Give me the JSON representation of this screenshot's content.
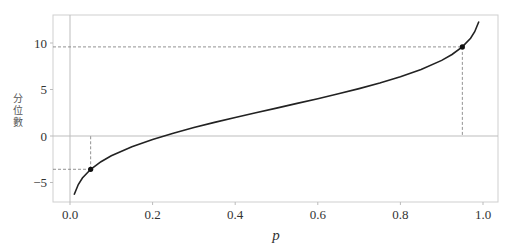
{
  "chart_data": {
    "type": "line",
    "title": "",
    "xlabel": "p",
    "ylabel": "分位數",
    "xlim": [
      -0.03,
      1.03
    ],
    "ylim": [
      -7.2,
      13.5
    ],
    "xticks": [
      0.0,
      0.2,
      0.4,
      0.6,
      0.8,
      1.0
    ],
    "xtick_labels": [
      "0.0",
      "0.2",
      "0.4",
      "0.6",
      "0.8",
      "1.0"
    ],
    "yticks": [
      -5,
      0,
      5,
      10
    ],
    "ytick_labels": [
      "−5",
      "0",
      "5",
      "10"
    ],
    "grid": false,
    "reference_lines": {
      "horizontal": 0,
      "vertical": 0
    },
    "series": [
      {
        "name": "quantile function (Normal μ=3, σ=4)",
        "x": [
          0.01,
          0.02,
          0.03,
          0.05,
          0.075,
          0.1,
          0.15,
          0.2,
          0.25,
          0.3,
          0.35,
          0.4,
          0.45,
          0.5,
          0.55,
          0.6,
          0.65,
          0.7,
          0.75,
          0.8,
          0.85,
          0.9,
          0.925,
          0.95,
          0.97,
          0.98,
          0.99
        ],
        "y": [
          -6.31,
          -5.21,
          -4.52,
          -3.58,
          -2.76,
          -2.13,
          -1.15,
          -0.37,
          0.3,
          0.9,
          1.46,
          1.99,
          2.5,
          3.0,
          3.5,
          4.01,
          4.54,
          5.1,
          5.7,
          6.37,
          7.15,
          8.13,
          8.76,
          9.58,
          10.52,
          11.21,
          12.31
        ]
      }
    ],
    "highlighted_points": [
      {
        "p": 0.05,
        "value": -3.58
      },
      {
        "p": 0.95,
        "value": 9.58
      }
    ]
  }
}
